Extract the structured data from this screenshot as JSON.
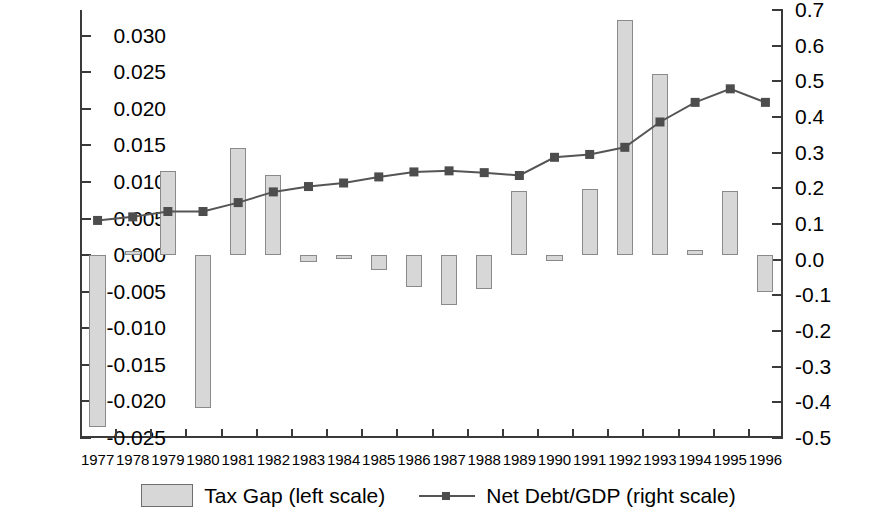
{
  "chart_data": {
    "type": "bar",
    "title": "",
    "subtitle": "",
    "xlabel": "",
    "ylabel": "",
    "grid": false,
    "legend_position": "bottom",
    "categories": [
      "1977",
      "1978",
      "1979",
      "1980",
      "1981",
      "1982",
      "1983",
      "1984",
      "1985",
      "1986",
      "1987",
      "1988",
      "1989",
      "1990",
      "1991",
      "1992",
      "1993",
      "1994",
      "1995",
      "1996"
    ],
    "left_axis": {
      "label": "Tax Gap (left scale)",
      "ylim": [
        -0.025,
        0.0335
      ],
      "ticks": [
        0.03,
        0.025,
        0.02,
        0.015,
        0.01,
        0.005,
        0.0,
        -0.005,
        -0.01,
        -0.015,
        -0.02,
        -0.025
      ],
      "tick_labels": [
        "0.030",
        "0.025",
        "0.020",
        "0.015",
        "0.010",
        "0.005",
        "0.000",
        "-0.005",
        "-0.010",
        "-0.015",
        "-0.020",
        "-0.025"
      ]
    },
    "right_axis": {
      "label": "Net Debt/GDP (right scale)",
      "ylim": [
        -0.5,
        0.7
      ],
      "ticks": [
        0.7,
        0.6,
        0.5,
        0.4,
        0.3,
        0.2,
        0.1,
        0.0,
        -0.1,
        -0.2,
        -0.3,
        -0.4,
        -0.5
      ],
      "tick_labels": [
        "0.7",
        "0.6",
        "0.5",
        "0.4",
        "0.3",
        "0.2",
        "0.1",
        "0.0",
        "-0.1",
        "-0.2",
        "-0.3",
        "-0.4",
        "-0.5"
      ]
    },
    "series": [
      {
        "name": "Tax Gap (left scale)",
        "type": "bar",
        "axis": "left",
        "color": "#d7d7d7",
        "edge_color": "#8a8a8a",
        "values": [
          -0.0235,
          0.0006,
          0.0115,
          -0.0209,
          0.0146,
          0.011,
          -0.001,
          -0.0005,
          -0.002,
          -0.0043,
          -0.0068,
          -0.0047,
          0.0087,
          -0.0008,
          0.009,
          0.0322,
          0.0247,
          0.0007,
          0.0088,
          -0.005
        ]
      },
      {
        "name": "Net Debt/GDP (right scale)",
        "type": "line",
        "axis": "right",
        "color": "#555555",
        "marker_color": "#4d4d4d",
        "values": [
          0.11,
          0.12,
          0.135,
          0.135,
          0.16,
          0.19,
          0.205,
          0.215,
          0.232,
          0.246,
          0.249,
          0.244,
          0.236,
          0.287,
          0.295,
          0.315,
          0.386,
          0.441,
          0.479,
          0.441
        ]
      }
    ]
  },
  "legend": {
    "items": [
      {
        "label": "Tax Gap (left scale)",
        "marker": "swatch"
      },
      {
        "label": "Net Debt/GDP (right scale)",
        "marker": "line-marker"
      }
    ]
  }
}
